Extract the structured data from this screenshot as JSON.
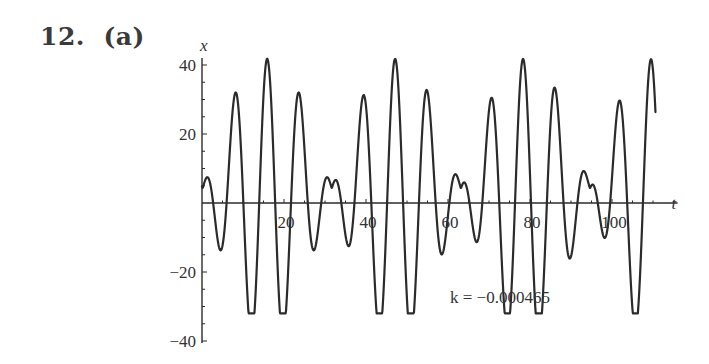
{
  "problem": {
    "number": "12.",
    "part": "(a)"
  },
  "chart_data": {
    "type": "line",
    "title": "",
    "xlabel": "t",
    "ylabel": "x",
    "xlim": [
      0,
      112
    ],
    "ylim": [
      -40,
      42
    ],
    "xticks": [
      20,
      40,
      60,
      80,
      100
    ],
    "xtick_labels": [
      "20",
      "40",
      "60",
      "80",
      "100"
    ],
    "yticks": [
      -40,
      -20,
      20,
      40
    ],
    "ytick_labels": [
      "−40",
      "−20",
      "20",
      "40"
    ],
    "grid": false,
    "legend": null,
    "annotation": "k = −0.000465",
    "series": [
      {
        "name": "x(t)",
        "x": [
          0,
          2,
          4,
          6,
          8,
          10,
          12,
          14,
          16,
          18,
          20,
          22,
          24,
          26,
          28,
          30,
          32,
          34,
          36,
          38,
          40,
          42,
          44,
          46,
          48,
          50,
          52,
          54,
          56,
          58,
          60,
          62,
          64,
          66,
          68,
          70,
          72,
          74,
          76,
          78,
          80,
          82,
          84,
          86,
          88,
          90,
          92,
          94,
          96,
          98,
          100,
          102,
          104,
          106,
          108,
          110
        ],
        "key_points": [
          {
            "t": 0,
            "x": 0
          },
          {
            "t": 1.5,
            "x": 4
          },
          {
            "t": 4.5,
            "x": -12
          },
          {
            "t": 8,
            "x": 21
          },
          {
            "t": 12,
            "x": -31
          },
          {
            "t": 16,
            "x": 42
          },
          {
            "t": 19.5,
            "x": -31
          },
          {
            "t": 23.5,
            "x": 21
          },
          {
            "t": 27,
            "x": -12
          },
          {
            "t": 29.5,
            "x": 4
          },
          {
            "t": 31.5,
            "x": 1
          },
          {
            "t": 33.5,
            "x": 4
          },
          {
            "t": 36,
            "x": -12
          },
          {
            "t": 39.5,
            "x": 21
          },
          {
            "t": 43.5,
            "x": -31
          },
          {
            "t": 47.5,
            "x": 42
          },
          {
            "t": 51,
            "x": -31
          },
          {
            "t": 55,
            "x": 21
          },
          {
            "t": 58.5,
            "x": -12
          },
          {
            "t": 61,
            "x": 4
          },
          {
            "t": 63,
            "x": 1
          },
          {
            "t": 65,
            "x": 4
          },
          {
            "t": 67.5,
            "x": -12
          },
          {
            "t": 71,
            "x": 21
          },
          {
            "t": 75,
            "x": -31
          },
          {
            "t": 79,
            "x": 42
          },
          {
            "t": 82.5,
            "x": -31
          },
          {
            "t": 86.5,
            "x": 21
          },
          {
            "t": 90,
            "x": -12
          },
          {
            "t": 92.5,
            "x": 4
          },
          {
            "t": 94.5,
            "x": 1
          },
          {
            "t": 96.5,
            "x": 4
          },
          {
            "t": 99,
            "x": -12
          },
          {
            "t": 102.5,
            "x": 21
          },
          {
            "t": 106.5,
            "x": -31
          },
          {
            "t": 110.5,
            "x": 42
          }
        ]
      }
    ]
  }
}
